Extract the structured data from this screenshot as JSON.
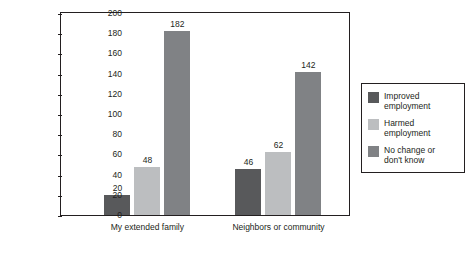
{
  "chart_data": {
    "type": "bar",
    "title": "",
    "xlabel": "",
    "ylabel": "Number of respondents",
    "ylim": [
      0,
      200
    ],
    "yticks": [
      0,
      20,
      40,
      60,
      80,
      100,
      120,
      140,
      160,
      180,
      200
    ],
    "grid": false,
    "legend_position": "right",
    "categories": [
      "My extended family",
      "Neighbors or community"
    ],
    "series": [
      {
        "name": "Improved employment",
        "color": "#58595b",
        "values": [
          20,
          46
        ]
      },
      {
        "name": "Harmed employment",
        "color": "#bcbec0",
        "values": [
          48,
          62
        ]
      },
      {
        "name": "No change or don't know",
        "color": "#808285",
        "values": [
          182,
          142
        ]
      }
    ]
  },
  "legend": {
    "entries": [
      "Improved\nemployment",
      "Harmed\nemployment",
      "No change or\ndon't know"
    ]
  }
}
